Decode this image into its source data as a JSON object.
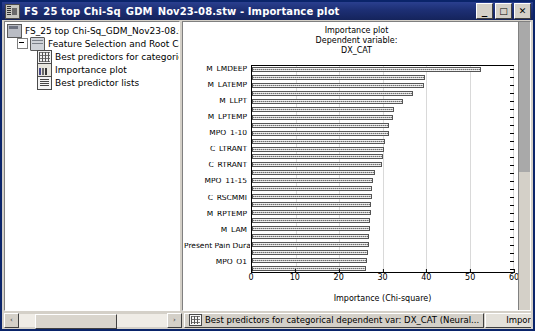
{
  "window": {
    "title": "FS_25 top Chi-Sq_GDM_Nov23-08.stw - Importance plot",
    "icon": "statistica-workbook-icon",
    "minimize_label": "_",
    "maximize_label": "□",
    "close_label": "✕"
  },
  "tree": {
    "items": [
      {
        "label": "FS_25 top Chi-Sq_GDM_Nov23-08.stw",
        "icon": "workbook-icon",
        "level": 1
      },
      {
        "label": "Feature Selection and Root Cause An",
        "icon": "folder-icon",
        "level": 2
      },
      {
        "label": "Best predictors for categorical dep",
        "icon": "spreadsheet-icon",
        "level": 3
      },
      {
        "label": "Importance plot",
        "icon": "chart-icon",
        "level": 3
      },
      {
        "label": "Best predictor lists",
        "icon": "list-icon",
        "level": 3
      }
    ],
    "scroll_left_label": "‹",
    "scroll_right_label": "›"
  },
  "chart_data": {
    "type": "bar",
    "orientation": "horizontal",
    "title": "Importance plot",
    "subtitle": "Dependent variable:",
    "dependent_variable": "DX_CAT",
    "xlabel": "Importance (Chi-square)",
    "ylabel": "",
    "xlim": [
      0,
      60
    ],
    "xticks": [
      0,
      10,
      20,
      30,
      40,
      50,
      60
    ],
    "grid": true,
    "legend": false,
    "bar_color": "#b4b4b4",
    "categories": [
      "M_LMDEEP",
      "",
      "M_LATEMP",
      "",
      "M_LLPT",
      "",
      "M_LPTEMP",
      "",
      "MPQ_1-10",
      "",
      "C_LTRANT",
      "",
      "C_RTRANT",
      "",
      "MPQ_11-15",
      "",
      "C_RSCMMI",
      "",
      "M_RPTEMP",
      "",
      "M_LAM",
      "",
      "Present Pain Duration",
      "",
      "MPQ_Q1",
      ""
    ],
    "values": [
      52.7,
      39.8,
      39.5,
      37.0,
      34.8,
      32.7,
      32.3,
      31.5,
      31.4,
      30.5,
      30.3,
      30.2,
      29.9,
      28.2,
      27.9,
      27.6,
      27.5,
      27.4,
      27.3,
      27.2,
      27.1,
      27.0,
      26.9,
      26.6,
      26.4,
      26.2
    ]
  },
  "plot_scrollbar": {
    "name": "plot-vertical-scrollbar"
  },
  "bottom": {
    "tabs": [
      {
        "label": "Best predictors for categorical dependent var: DX_CAT (Neural...",
        "icon": "spreadsheet-icon",
        "active": false
      },
      {
        "label": "Importance plot",
        "icon": "chart-icon",
        "active": true
      },
      {
        "label": "Best p",
        "icon": "list-icon",
        "active": false
      }
    ],
    "nav_prev": "◄",
    "nav_next": "►",
    "scroll_left_label": "‹",
    "scroll_right_label": "›"
  }
}
